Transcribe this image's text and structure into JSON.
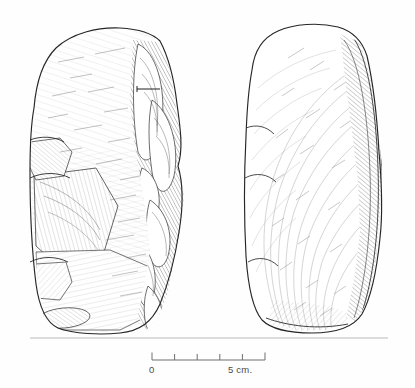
{
  "figure": {
    "medium": "pen-and-ink archaeological illustration",
    "ink_color": "#2b2b2b",
    "background_color": "#fefefe",
    "baseline_color": "#b9b9b9",
    "views": [
      {
        "id": "left-view",
        "label": "dorsal / flaked face view",
        "position": "left",
        "worked_edge_side": "right",
        "section_marker": "horizontal tick line on upper right edge"
      },
      {
        "id": "right-view",
        "label": "ventral / cortical face view",
        "position": "right",
        "worked_edge_side": "right",
        "section_marker": "none"
      }
    ],
    "baseline": {
      "present": true,
      "y": 338
    }
  },
  "scale": {
    "name": "scale-bar",
    "min_label": "0",
    "max_label": "5  cm.",
    "units": "cm",
    "min_value": 0,
    "max_value": 5,
    "major_ticks": 6,
    "tick_values": [
      0,
      1,
      2,
      3,
      4,
      5
    ],
    "bar_color": "#6e6e6e",
    "label_color": "#4a4a4a"
  }
}
